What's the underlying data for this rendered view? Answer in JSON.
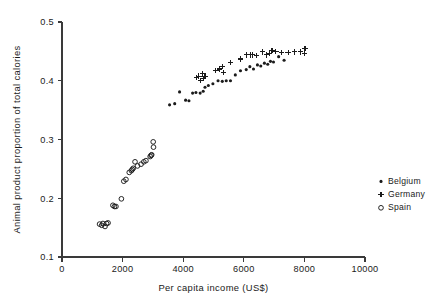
{
  "chart_data": {
    "type": "scatter",
    "title": "",
    "xlabel": "Per capita income (US$)",
    "ylabel": "Animal product proportion of total calories",
    "xlim": [
      0,
      10000
    ],
    "ylim": [
      0.1,
      0.5
    ],
    "xticks": [
      0,
      2000,
      4000,
      6000,
      8000,
      10000
    ],
    "xtick_labels": [
      "0",
      "2000",
      "4000",
      "6000",
      "8000",
      "10000"
    ],
    "yticks": [
      0.1,
      0.2,
      0.3,
      0.4,
      0.5
    ],
    "ytick_labels": [
      "0.1",
      "0.2",
      "0.3",
      "0.4",
      "0.5"
    ],
    "grid": false,
    "legend_position": "right",
    "series": [
      {
        "name": "Belgium",
        "marker": "dot",
        "color": "#1b1b1b",
        "points": [
          [
            3550,
            0.359
          ],
          [
            3720,
            0.361
          ],
          [
            3880,
            0.381
          ],
          [
            4080,
            0.367
          ],
          [
            4190,
            0.366
          ],
          [
            4310,
            0.379
          ],
          [
            4420,
            0.38
          ],
          [
            4560,
            0.379
          ],
          [
            4660,
            0.382
          ],
          [
            4720,
            0.389
          ],
          [
            4830,
            0.392
          ],
          [
            4980,
            0.395
          ],
          [
            5150,
            0.4
          ],
          [
            5290,
            0.399
          ],
          [
            5420,
            0.4
          ],
          [
            5560,
            0.4
          ],
          [
            5720,
            0.41
          ],
          [
            5890,
            0.417
          ],
          [
            6080,
            0.419
          ],
          [
            6200,
            0.424
          ],
          [
            6320,
            0.42
          ],
          [
            6450,
            0.427
          ],
          [
            6560,
            0.425
          ],
          [
            6680,
            0.43
          ],
          [
            6790,
            0.428
          ],
          [
            6880,
            0.433
          ],
          [
            6980,
            0.432
          ],
          [
            7150,
            0.441
          ],
          [
            7330,
            0.435
          ]
        ]
      },
      {
        "name": "Germany",
        "marker": "plus",
        "color": "#1b1b1b",
        "points": [
          [
            4430,
            0.405
          ],
          [
            4520,
            0.408
          ],
          [
            4560,
            0.4
          ],
          [
            4640,
            0.412
          ],
          [
            4670,
            0.404
          ],
          [
            4720,
            0.408
          ],
          [
            5080,
            0.417
          ],
          [
            5190,
            0.42
          ],
          [
            5290,
            0.424
          ],
          [
            5330,
            0.414
          ],
          [
            5560,
            0.431
          ],
          [
            5880,
            0.437
          ],
          [
            6100,
            0.444
          ],
          [
            6230,
            0.444
          ],
          [
            6300,
            0.444
          ],
          [
            6420,
            0.443
          ],
          [
            6620,
            0.449
          ],
          [
            6760,
            0.444
          ],
          [
            6840,
            0.447
          ],
          [
            6930,
            0.452
          ],
          [
            7060,
            0.45
          ],
          [
            7240,
            0.448
          ],
          [
            7460,
            0.448
          ],
          [
            7680,
            0.449
          ],
          [
            7870,
            0.449
          ],
          [
            8020,
            0.455
          ],
          [
            8000,
            0.447
          ]
        ]
      },
      {
        "name": "Spain",
        "marker": "circle",
        "color": "#1b1b1b",
        "points": [
          [
            1240,
            0.156
          ],
          [
            1310,
            0.154
          ],
          [
            1350,
            0.157
          ],
          [
            1420,
            0.152
          ],
          [
            1470,
            0.157
          ],
          [
            1520,
            0.158
          ],
          [
            1680,
            0.188
          ],
          [
            1730,
            0.186
          ],
          [
            1780,
            0.186
          ],
          [
            1960,
            0.199
          ],
          [
            2040,
            0.229
          ],
          [
            2110,
            0.232
          ],
          [
            2220,
            0.244
          ],
          [
            2290,
            0.247
          ],
          [
            2320,
            0.249
          ],
          [
            2350,
            0.251
          ],
          [
            2410,
            0.262
          ],
          [
            2490,
            0.255
          ],
          [
            2610,
            0.258
          ],
          [
            2700,
            0.262
          ],
          [
            2770,
            0.264
          ],
          [
            2910,
            0.271
          ],
          [
            2940,
            0.273
          ],
          [
            2960,
            0.274
          ],
          [
            3010,
            0.296
          ],
          [
            3020,
            0.287
          ]
        ]
      }
    ]
  },
  "legend": {
    "items": [
      {
        "label": "Belgium",
        "marker": "dot"
      },
      {
        "label": "Germany",
        "marker": "plus"
      },
      {
        "label": "Spain",
        "marker": "circle"
      }
    ]
  }
}
